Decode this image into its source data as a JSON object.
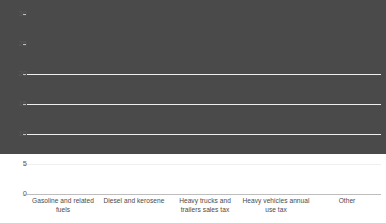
{
  "chart_data": {
    "type": "bar",
    "title": "",
    "subtitle": "",
    "xlabel": "",
    "ylabel": "",
    "categories": [
      "Gasoline and related fuels",
      "Diesel and kerosene",
      "Heavy trucks and trailers sales tax",
      "Heavy vehicles annual use tax",
      "Other"
    ],
    "values": [
      25.6,
      9.5,
      4.0,
      0.9,
      0.4
    ],
    "ylim": [
      0,
      30
    ],
    "yticks": [
      0,
      5,
      10,
      15,
      20,
      25,
      30
    ],
    "ytick_labels": [
      "0",
      "5",
      "10",
      "15",
      "20",
      "25",
      "30"
    ],
    "grid": true,
    "legend": false,
    "series": [
      {
        "name": "",
        "values": [
          25.6,
          9.5,
          4.0,
          0.9,
          0.4
        ]
      }
    ],
    "colors": {
      "bar": "#4a4a4a",
      "gridline": "#efefef",
      "axis": "#bdbdbd",
      "text": "#4a4a4a",
      "background": "#ffffff"
    }
  }
}
